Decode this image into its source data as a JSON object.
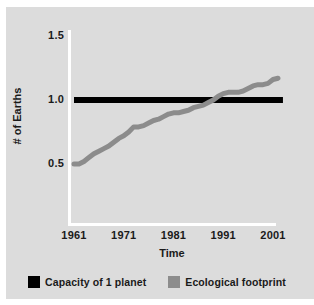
{
  "chart_data": {
    "type": "line",
    "title": "",
    "xlabel": "Time",
    "ylabel": "# of Earths",
    "xlim": [
      1961,
      2003
    ],
    "ylim": [
      0.25,
      1.5
    ],
    "grid": false,
    "legend_position": "bottom",
    "y_ticks": [
      "1.5",
      "1.0",
      "0.5"
    ],
    "y_tick_values": [
      1.5,
      1.0,
      0.5
    ],
    "x_ticks": [
      "1961",
      "1971",
      "1981",
      "1991",
      "2001"
    ],
    "x_tick_values": [
      1961,
      1971,
      1981,
      1991,
      2001
    ],
    "series": [
      {
        "name": "Capacity of 1 planet",
        "color": "#000000",
        "type": "constant-line",
        "value": 1.0,
        "x": [
          1961,
          2003
        ],
        "values": [
          1.0,
          1.0
        ]
      },
      {
        "name": "Ecological footprint",
        "color": "#8c8c8c",
        "type": "line",
        "x": [
          1961,
          1962,
          1963,
          1964,
          1965,
          1966,
          1967,
          1968,
          1969,
          1970,
          1971,
          1972,
          1973,
          1974,
          1975,
          1976,
          1977,
          1978,
          1979,
          1980,
          1981,
          1982,
          1983,
          1984,
          1985,
          1986,
          1987,
          1988,
          1989,
          1990,
          1991,
          1992,
          1993,
          1994,
          1995,
          1996,
          1997,
          1998,
          1999,
          2000,
          2001,
          2002
        ],
        "values": [
          0.5,
          0.5,
          0.52,
          0.55,
          0.58,
          0.6,
          0.62,
          0.64,
          0.67,
          0.7,
          0.72,
          0.75,
          0.79,
          0.79,
          0.8,
          0.82,
          0.84,
          0.85,
          0.87,
          0.89,
          0.9,
          0.9,
          0.91,
          0.92,
          0.94,
          0.95,
          0.96,
          0.98,
          1.0,
          1.03,
          1.05,
          1.06,
          1.06,
          1.06,
          1.07,
          1.09,
          1.11,
          1.12,
          1.12,
          1.13,
          1.16,
          1.17
        ]
      }
    ]
  },
  "legend": {
    "entries": [
      {
        "label": "Capacity of 1 planet",
        "color": "#000000"
      },
      {
        "label": "Ecological footprint",
        "color": "#8c8c8c"
      }
    ]
  },
  "colors": {
    "panel_background": "#dcdcdc",
    "figure_background": "#ffffff",
    "axis": "#ffffff",
    "text": "#1a1a1a",
    "capacity_line": "#000000",
    "footprint_line": "#8c8c8c"
  }
}
